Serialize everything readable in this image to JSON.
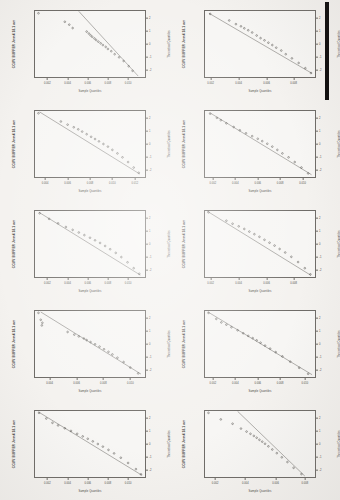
{
  "document": {
    "type": "normal-probability-plot-grid",
    "rows": 5,
    "cols": 2,
    "background_color": "#f4f2ef",
    "ink_color": "#44413d"
  },
  "artifacts": {
    "scan_bar": {
      "name": "black-scan-bar",
      "color": "#0d0c0c",
      "x": 325,
      "y": 2,
      "width": 4,
      "height": 98
    }
  },
  "common": {
    "xlabel": "Sample Quantiles",
    "right_ylabel": "Theoretical Quantiles",
    "right_ticks": [
      "-2",
      "-1",
      "0",
      "1",
      "2"
    ]
  },
  "chart_data": [
    {
      "id": "panel-1",
      "type": "scatter",
      "title": "",
      "ylabel": "CCMV BUFFER Jmm4 18.1 nm",
      "xlabel": "Sample Quantiles",
      "right_ylabel": "Theoretical Quantiles",
      "xlim": [
        0.0,
        1.0
      ],
      "ylim": [
        -2.6,
        2.6
      ],
      "xticks": [
        "0.002",
        "0.004",
        "0.006",
        "0.008",
        "0.010"
      ],
      "xtick_pos": [
        0.12,
        0.3,
        0.48,
        0.66,
        0.84
      ],
      "yticks": [
        "-2",
        "-1",
        "0",
        "1",
        "2"
      ],
      "grid": false,
      "fit_line": {
        "x0": 0.4,
        "y0": 2.5,
        "x1": 0.93,
        "y1": -2.45
      },
      "points_x": [
        0.04,
        0.275,
        0.315,
        0.345,
        0.47,
        0.49,
        0.505,
        0.52,
        0.54,
        0.555,
        0.575,
        0.595,
        0.615,
        0.64,
        0.66,
        0.69,
        0.72,
        0.76,
        0.8,
        0.845,
        0.88
      ],
      "points_y": [
        2.35,
        1.7,
        1.48,
        1.22,
        0.95,
        0.8,
        0.66,
        0.55,
        0.42,
        0.3,
        0.18,
        0.05,
        -0.08,
        -0.22,
        -0.38,
        -0.55,
        -0.78,
        -1.02,
        -1.3,
        -1.7,
        -2.05
      ]
    },
    {
      "id": "panel-2",
      "type": "scatter",
      "title": "",
      "ylabel": "CCMV BUFFER Jmm4 18.1 nm",
      "xlabel": "Sample Quantiles",
      "right_ylabel": "Theoretical Quantiles",
      "xlim": [
        0.0,
        1.0
      ],
      "ylim": [
        -2.6,
        2.6
      ],
      "xticks": [
        "0.002",
        "0.004",
        "0.006",
        "0.008"
      ],
      "xtick_pos": [
        0.06,
        0.31,
        0.56,
        0.8
      ],
      "yticks": [
        "-2",
        "-1",
        "0",
        "1",
        "2"
      ],
      "grid": false,
      "fit_line": {
        "x0": 0.045,
        "y0": 2.35,
        "x1": 0.965,
        "y1": -2.25
      },
      "points_x": [
        0.055,
        0.225,
        0.285,
        0.33,
        0.36,
        0.395,
        0.43,
        0.47,
        0.505,
        0.54,
        0.575,
        0.61,
        0.645,
        0.69,
        0.73,
        0.785,
        0.845,
        0.905,
        0.955
      ],
      "points_y": [
        2.3,
        1.8,
        1.52,
        1.35,
        1.2,
        1.05,
        0.88,
        0.65,
        0.45,
        0.28,
        0.1,
        -0.08,
        -0.28,
        -0.5,
        -0.78,
        -1.1,
        -1.45,
        -1.85,
        -2.22
      ]
    },
    {
      "id": "panel-3",
      "type": "scatter",
      "title": "",
      "ylabel": "CCMV BUFFER Jmm4 18.1 nm",
      "xlabel": "Sample Quantiles",
      "right_ylabel": "Theoretical Quantiles",
      "xlim": [
        0.0,
        1.0
      ],
      "ylim": [
        -2.6,
        2.6
      ],
      "xticks": [
        "0.004",
        "0.006",
        "0.008",
        "0.010",
        "0.012"
      ],
      "xtick_pos": [
        0.1,
        0.3,
        0.5,
        0.7,
        0.9
      ],
      "yticks": [
        "-2",
        "-1",
        "0",
        "1",
        "2"
      ],
      "grid": false,
      "fit_line": {
        "x0": 0.05,
        "y0": 2.45,
        "x1": 0.945,
        "y1": -2.3
      },
      "points_x": [
        0.04,
        0.24,
        0.3,
        0.355,
        0.395,
        0.43,
        0.47,
        0.51,
        0.545,
        0.58,
        0.62,
        0.66,
        0.7,
        0.745,
        0.79,
        0.84,
        0.89,
        0.935
      ],
      "points_y": [
        2.35,
        1.72,
        1.48,
        1.28,
        1.12,
        0.95,
        0.75,
        0.55,
        0.38,
        0.2,
        0.0,
        -0.2,
        -0.45,
        -0.72,
        -1.02,
        -1.38,
        -1.8,
        -2.2
      ]
    },
    {
      "id": "panel-4",
      "type": "scatter",
      "title": "",
      "ylabel": "CCMV BUFFER Jmm4 18.1 nm",
      "xlabel": "Sample Quantiles",
      "right_ylabel": "Theoretical Quantiles",
      "xlim": [
        0.0,
        1.0
      ],
      "ylim": [
        -2.6,
        2.6
      ],
      "xticks": [
        "0.002",
        "0.004",
        "0.006",
        "0.008",
        "0.010"
      ],
      "xtick_pos": [
        0.08,
        0.28,
        0.48,
        0.68,
        0.88
      ],
      "yticks": [
        "-2",
        "-1",
        "0",
        "1",
        "2"
      ],
      "grid": false,
      "fit_line": {
        "x0": 0.05,
        "y0": 2.4,
        "x1": 0.96,
        "y1": -2.35
      },
      "points_x": [
        0.055,
        0.115,
        0.15,
        0.2,
        0.265,
        0.32,
        0.375,
        0.43,
        0.48,
        0.52,
        0.565,
        0.61,
        0.655,
        0.7,
        0.755,
        0.81,
        0.87,
        0.93
      ],
      "points_y": [
        2.32,
        2.0,
        1.82,
        1.58,
        1.3,
        1.05,
        0.82,
        0.6,
        0.4,
        0.22,
        0.02,
        -0.2,
        -0.45,
        -0.72,
        -1.02,
        -1.38,
        -1.8,
        -2.25
      ]
    },
    {
      "id": "panel-5",
      "type": "scatter",
      "title": "",
      "ylabel": "CCMV BUFFER Jmm4 18.1 nm",
      "xlabel": "Sample Quantiles",
      "right_ylabel": "Theoretical Quantiles",
      "xlim": [
        0.0,
        1.0
      ],
      "ylim": [
        -2.6,
        2.6
      ],
      "xticks": [
        "0.002",
        "0.004",
        "0.006",
        "0.008",
        "0.010"
      ],
      "xtick_pos": [
        0.12,
        0.3,
        0.48,
        0.66,
        0.84
      ],
      "yticks": [
        "-2",
        "-1",
        "0",
        "1",
        "2"
      ],
      "grid": false,
      "fit_line": {
        "x0": 0.045,
        "y0": 2.42,
        "x1": 0.95,
        "y1": -2.38
      },
      "points_x": [
        0.05,
        0.135,
        0.215,
        0.285,
        0.345,
        0.4,
        0.45,
        0.5,
        0.545,
        0.59,
        0.635,
        0.68,
        0.73,
        0.78,
        0.835,
        0.89,
        0.94
      ],
      "points_y": [
        2.35,
        1.92,
        1.58,
        1.3,
        1.08,
        0.88,
        0.68,
        0.48,
        0.28,
        0.08,
        -0.15,
        -0.4,
        -0.68,
        -1.0,
        -1.4,
        -1.85,
        -2.28
      ]
    },
    {
      "id": "panel-6",
      "type": "scatter",
      "title": "",
      "ylabel": "CCMV BUFFER Jmm4 18.1 nm",
      "xlabel": "Sample Quantiles",
      "right_ylabel": "Theoretical Quantiles",
      "xlim": [
        0.0,
        1.0
      ],
      "ylim": [
        -2.6,
        2.6
      ],
      "xticks": [
        "0.002",
        "0.004",
        "0.006",
        "0.008"
      ],
      "xtick_pos": [
        0.06,
        0.31,
        0.56,
        0.8
      ],
      "yticks": [
        "-2",
        "-1",
        "0",
        "1",
        "2"
      ],
      "grid": false,
      "fit_line": {
        "x0": 0.03,
        "y0": 2.5,
        "x1": 0.955,
        "y1": -2.4
      },
      "points_x": [
        0.04,
        0.2,
        0.255,
        0.31,
        0.36,
        0.405,
        0.45,
        0.495,
        0.54,
        0.585,
        0.63,
        0.675,
        0.725,
        0.78,
        0.84,
        0.9,
        0.95
      ],
      "points_y": [
        2.42,
        1.78,
        1.55,
        1.35,
        1.15,
        0.95,
        0.75,
        0.55,
        0.32,
        0.1,
        -0.12,
        -0.38,
        -0.65,
        -0.98,
        -1.38,
        -1.85,
        -2.32
      ]
    },
    {
      "id": "panel-7",
      "type": "scatter",
      "title": "",
      "ylabel": "CCMV BUFFER Jmm4 18.1 nm",
      "xlabel": "Sample Quantiles",
      "right_ylabel": "Theoretical Quantiles",
      "xlim": [
        0.0,
        1.0
      ],
      "ylim": [
        -2.6,
        2.6
      ],
      "xticks": [
        "0.004",
        "0.006",
        "0.008",
        "0.010"
      ],
      "xtick_pos": [
        0.14,
        0.38,
        0.62,
        0.86
      ],
      "yticks": [
        "-2",
        "-1",
        "0",
        "1",
        "2"
      ],
      "grid": false,
      "fit_line": {
        "x0": 0.06,
        "y0": 2.45,
        "x1": 0.955,
        "y1": -2.3
      },
      "points_x": [
        0.04,
        0.06,
        0.075,
        0.07,
        0.3,
        0.36,
        0.4,
        0.445,
        0.47,
        0.505,
        0.545,
        0.585,
        0.625,
        0.665,
        0.7,
        0.745,
        0.8,
        0.86,
        0.93
      ],
      "points_y": [
        2.38,
        1.85,
        1.62,
        1.42,
        0.92,
        0.72,
        0.58,
        0.42,
        0.3,
        0.15,
        -0.02,
        -0.2,
        -0.4,
        -0.6,
        -0.8,
        -1.05,
        -1.38,
        -1.8,
        -2.25
      ]
    },
    {
      "id": "panel-8",
      "type": "scatter",
      "title": "",
      "ylabel": "CCMV BUFFER Jmm4 18.1 nm",
      "xlabel": "Sample Quantiles",
      "right_ylabel": "Theoretical Quantiles",
      "xlim": [
        0.0,
        1.0
      ],
      "ylim": [
        -2.6,
        2.6
      ],
      "xticks": [
        "0.002",
        "0.004",
        "0.006",
        "0.008",
        "0.010"
      ],
      "xtick_pos": [
        0.08,
        0.28,
        0.48,
        0.68,
        0.9
      ],
      "yticks": [
        "-2",
        "-1",
        "0",
        "1",
        "2"
      ],
      "grid": false,
      "fit_line": {
        "x0": 0.035,
        "y0": 2.45,
        "x1": 0.965,
        "y1": -2.35
      },
      "points_x": [
        0.04,
        0.11,
        0.155,
        0.2,
        0.245,
        0.3,
        0.35,
        0.395,
        0.435,
        0.47,
        0.505,
        0.545,
        0.59,
        0.64,
        0.7,
        0.77,
        0.85,
        0.93
      ],
      "points_y": [
        2.38,
        1.92,
        1.65,
        1.48,
        1.28,
        1.05,
        0.82,
        0.62,
        0.45,
        0.28,
        0.1,
        -0.12,
        -0.35,
        -0.62,
        -0.95,
        -1.35,
        -1.82,
        -2.28
      ]
    },
    {
      "id": "panel-9",
      "type": "scatter",
      "title": "",
      "ylabel": "CCMV BUFFER Jmm4 18.1 nm",
      "xlabel": "Sample Quantiles",
      "right_ylabel": "Theoretical Quantiles",
      "xlim": [
        0.0,
        1.0
      ],
      "ylim": [
        -2.6,
        2.6
      ],
      "xticks": [
        "0.002",
        "0.004",
        "0.006",
        "0.008",
        "0.010"
      ],
      "xtick_pos": [
        0.12,
        0.3,
        0.48,
        0.66,
        0.84
      ],
      "yticks": [
        "-2",
        "-1",
        "0",
        "1",
        "2"
      ],
      "grid": false,
      "fit_line": {
        "x0": 0.04,
        "y0": 2.45,
        "x1": 0.965,
        "y1": -2.4
      },
      "points_x": [
        0.045,
        0.11,
        0.165,
        0.215,
        0.275,
        0.33,
        0.385,
        0.435,
        0.48,
        0.525,
        0.57,
        0.615,
        0.665,
        0.715,
        0.775,
        0.84,
        0.91,
        0.955
      ],
      "points_y": [
        2.38,
        1.95,
        1.62,
        1.42,
        1.2,
        1.0,
        0.78,
        0.58,
        0.4,
        0.2,
        0.0,
        -0.2,
        -0.45,
        -0.72,
        -1.05,
        -1.45,
        -1.92,
        -2.32
      ]
    },
    {
      "id": "panel-10",
      "type": "scatter",
      "title": "",
      "ylabel": "CCMV BUFFER Jmm4 18.1 nm",
      "xlabel": "Sample Quantiles",
      "right_ylabel": "Theoretical Quantiles",
      "xlim": [
        0.0,
        1.0
      ],
      "ylim": [
        -2.6,
        2.6
      ],
      "xticks": [
        "0.002",
        "0.004",
        "0.006",
        "0.008"
      ],
      "xtick_pos": [
        0.1,
        0.37,
        0.64,
        0.9
      ],
      "yticks": [
        "-2",
        "-1",
        "0",
        "1",
        "2"
      ],
      "grid": false,
      "fit_line": {
        "x0": 0.3,
        "y0": 2.5,
        "x1": 0.9,
        "y1": -2.45
      },
      "points_x": [
        0.04,
        0.15,
        0.255,
        0.33,
        0.38,
        0.415,
        0.445,
        0.47,
        0.495,
        0.52,
        0.545,
        0.575,
        0.61,
        0.65,
        0.695,
        0.745,
        0.8,
        0.87
      ],
      "points_y": [
        2.38,
        1.88,
        1.55,
        1.18,
        0.95,
        0.78,
        0.62,
        0.48,
        0.32,
        0.18,
        0.02,
        -0.18,
        -0.42,
        -0.7,
        -1.02,
        -1.38,
        -1.82,
        -2.3
      ]
    }
  ]
}
